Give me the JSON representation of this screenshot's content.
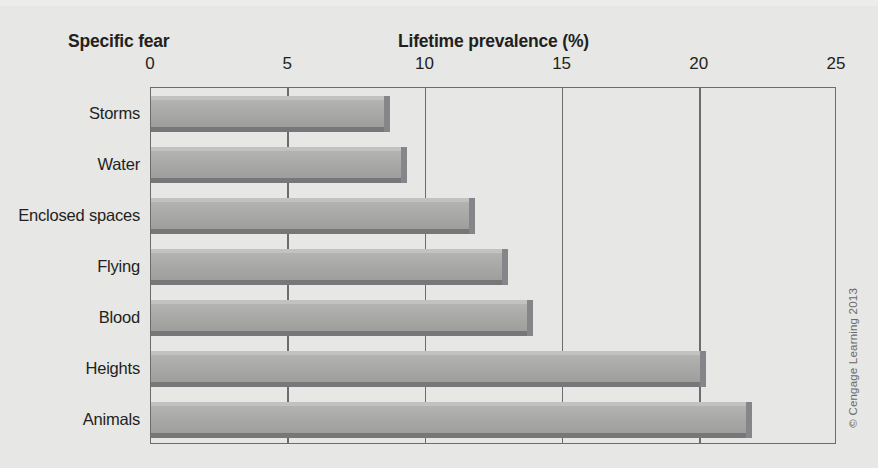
{
  "figure": {
    "category_header": "Specific fear",
    "credit": "© Cengage Learning 2013"
  },
  "chart_data": {
    "type": "bar",
    "orientation": "horizontal",
    "title": "Lifetime prevalence (%)",
    "xlabel": "Lifetime prevalence (%)",
    "ylabel": "Specific fear",
    "categories": [
      "Storms",
      "Water",
      "Enclosed spaces",
      "Flying",
      "Blood",
      "Heights",
      "Animals"
    ],
    "values": [
      8.5,
      9.1,
      11.6,
      12.8,
      13.7,
      20.0,
      21.7
    ],
    "xlim": [
      0,
      25
    ],
    "xticks": [
      0,
      5,
      10,
      15,
      20,
      25
    ],
    "xtick_labels": [
      "0",
      "5",
      "10",
      "15",
      "20",
      "25"
    ],
    "grid": "vertical",
    "legend": "none",
    "bar_color": "#a9a9a7",
    "bar_shadow_color": "#77777a",
    "axis_color": "#6c6c6c",
    "background_color": "#e7e7e5",
    "text_color": "#231f20"
  }
}
